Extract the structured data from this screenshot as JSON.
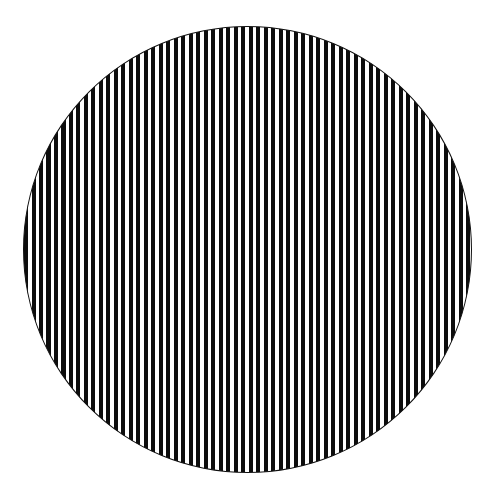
{
  "figure": {
    "shape": "circle",
    "pattern": "vertical-stripes",
    "stripe_color": "#0d0d0d",
    "background_color": "#ffffff",
    "stripe_period_px": 7.5,
    "stripe_width_px": 4
  }
}
